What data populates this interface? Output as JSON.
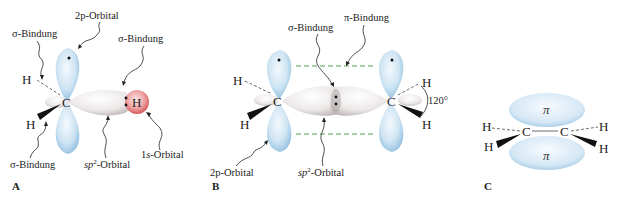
{
  "panels": {
    "A": {
      "label": "A",
      "labels": {
        "p_orbital": "2p-Orbital",
        "sigma_top": "σ-Bindung",
        "sigma_right": "σ-Bindung",
        "sigma_bottom": "σ-Bindung",
        "sp2_orbital": "sp²-Orbital",
        "s_orbital": "1s-Orbital"
      },
      "atoms": {
        "C": "C",
        "H1": "H",
        "H2": "H",
        "H3": "H"
      }
    },
    "B": {
      "label": "B",
      "labels": {
        "sigma": "σ-Bindung",
        "pi": "π-Bindung",
        "p_orbital": "2p-Orbital",
        "sp2_orbital": "sp²-Orbital",
        "angle": "120°"
      },
      "atoms": {
        "C1": "C",
        "C2": "C",
        "H": "H"
      }
    },
    "C": {
      "label": "C",
      "pi_top": "π",
      "pi_bottom": "π",
      "atoms": {
        "C": "C",
        "H": "H"
      }
    }
  },
  "colors": {
    "p_orbital": "#b9d9ef",
    "sp2_orbital": "#e6e2e2",
    "s_orbital": "#e07a7a",
    "pi_dash": "#3a9a3a"
  }
}
